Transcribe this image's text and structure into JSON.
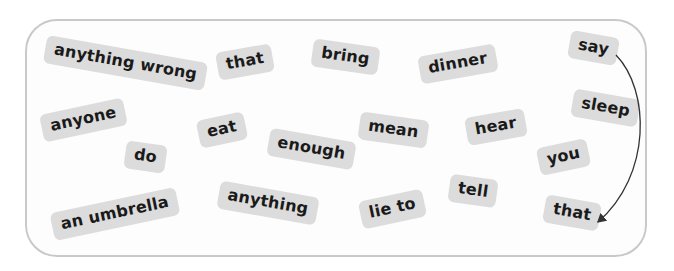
{
  "tiles": [
    {
      "id": "anything-wrong",
      "label": "anything wrong",
      "x": 125,
      "y": 63,
      "rot": 10
    },
    {
      "id": "that-1",
      "label": "that",
      "x": 245,
      "y": 62,
      "rot": -10
    },
    {
      "id": "bring",
      "label": "bring",
      "x": 345,
      "y": 57,
      "rot": 8
    },
    {
      "id": "dinner",
      "label": "dinner",
      "x": 458,
      "y": 64,
      "rot": -10
    },
    {
      "id": "say",
      "label": "say",
      "x": 593,
      "y": 48,
      "rot": 10
    },
    {
      "id": "anyone",
      "label": "anyone",
      "x": 83,
      "y": 120,
      "rot": -12
    },
    {
      "id": "eat",
      "label": "eat",
      "x": 222,
      "y": 130,
      "rot": -12
    },
    {
      "id": "enough",
      "label": "enough",
      "x": 311,
      "y": 149,
      "rot": 10
    },
    {
      "id": "mean",
      "label": "mean",
      "x": 393,
      "y": 130,
      "rot": 8
    },
    {
      "id": "hear",
      "label": "hear",
      "x": 496,
      "y": 127,
      "rot": -10
    },
    {
      "id": "sleep",
      "label": "sleep",
      "x": 605,
      "y": 108,
      "rot": 10
    },
    {
      "id": "do",
      "label": "do",
      "x": 145,
      "y": 157,
      "rot": 8
    },
    {
      "id": "you",
      "label": "you",
      "x": 563,
      "y": 157,
      "rot": -12
    },
    {
      "id": "an-umbrella",
      "label": "an umbrella",
      "x": 115,
      "y": 214,
      "rot": -12
    },
    {
      "id": "anything",
      "label": "anything",
      "x": 268,
      "y": 203,
      "rot": 10
    },
    {
      "id": "lie-to",
      "label": "lie to",
      "x": 392,
      "y": 209,
      "rot": -12
    },
    {
      "id": "tell",
      "label": "tell",
      "x": 473,
      "y": 191,
      "rot": 8
    },
    {
      "id": "that-2",
      "label": "that",
      "x": 572,
      "y": 213,
      "rot": 10
    }
  ],
  "arrow": {
    "from": "say",
    "to": "that-2",
    "color": "#333333"
  }
}
